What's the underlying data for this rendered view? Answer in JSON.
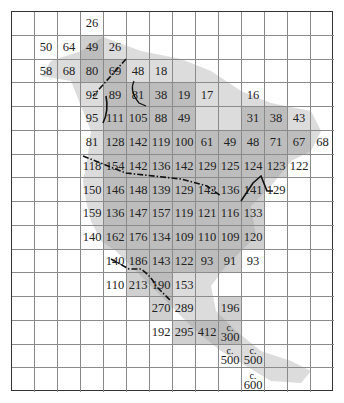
{
  "map": {
    "grid": {
      "cols": 14,
      "rows": 16
    },
    "colors": {
      "land": "#dcdcdc",
      "shaded": "#b5b5b5",
      "grid_line": "#8a8a8a",
      "border": "#333333",
      "text": "#222222"
    },
    "cells": [
      {
        "r": 0,
        "c": 3,
        "v": "26"
      },
      {
        "r": 1,
        "c": 1,
        "v": "50"
      },
      {
        "r": 1,
        "c": 2,
        "v": "64"
      },
      {
        "r": 1,
        "c": 3,
        "v": "49",
        "s": true
      },
      {
        "r": 1,
        "c": 4,
        "v": "26"
      },
      {
        "r": 2,
        "c": 1,
        "v": "58"
      },
      {
        "r": 2,
        "c": 2,
        "v": "68"
      },
      {
        "r": 2,
        "c": 3,
        "v": "80",
        "s": true
      },
      {
        "r": 2,
        "c": 4,
        "v": "69",
        "s": true
      },
      {
        "r": 2,
        "c": 5,
        "v": "48"
      },
      {
        "r": 2,
        "c": 6,
        "v": "18"
      },
      {
        "r": 3,
        "c": 3,
        "v": "92"
      },
      {
        "r": 3,
        "c": 4,
        "v": "89",
        "s": true
      },
      {
        "r": 3,
        "c": 5,
        "v": "81",
        "s": true
      },
      {
        "r": 3,
        "c": 6,
        "v": "38",
        "s": true
      },
      {
        "r": 3,
        "c": 7,
        "v": "19",
        "s": true
      },
      {
        "r": 3,
        "c": 8,
        "v": "17"
      },
      {
        "r": 3,
        "c": 10,
        "v": "16"
      },
      {
        "r": 4,
        "c": 3,
        "v": "95"
      },
      {
        "r": 4,
        "c": 4,
        "v": "111",
        "s": true
      },
      {
        "r": 4,
        "c": 5,
        "v": "105",
        "s": true
      },
      {
        "r": 4,
        "c": 6,
        "v": "88",
        "s": true
      },
      {
        "r": 4,
        "c": 7,
        "v": "49",
        "s": true
      },
      {
        "r": 4,
        "c": 10,
        "v": "31",
        "s": true
      },
      {
        "r": 4,
        "c": 11,
        "v": "38",
        "s": true
      },
      {
        "r": 4,
        "c": 12,
        "v": "43"
      },
      {
        "r": 5,
        "c": 3,
        "v": "81"
      },
      {
        "r": 5,
        "c": 4,
        "v": "128",
        "s": true
      },
      {
        "r": 5,
        "c": 5,
        "v": "142",
        "s": true
      },
      {
        "r": 5,
        "c": 6,
        "v": "119",
        "s": true
      },
      {
        "r": 5,
        "c": 7,
        "v": "100",
        "s": true
      },
      {
        "r": 5,
        "c": 8,
        "v": "61",
        "s": true
      },
      {
        "r": 5,
        "c": 9,
        "v": "49",
        "s": true
      },
      {
        "r": 5,
        "c": 10,
        "v": "48",
        "s": true
      },
      {
        "r": 5,
        "c": 11,
        "v": "71",
        "s": true
      },
      {
        "r": 5,
        "c": 12,
        "v": "67",
        "s": true
      },
      {
        "r": 5,
        "c": 13,
        "v": "68"
      },
      {
        "r": 6,
        "c": 3,
        "v": "118"
      },
      {
        "r": 6,
        "c": 4,
        "v": "154",
        "s": true
      },
      {
        "r": 6,
        "c": 5,
        "v": "142",
        "s": true
      },
      {
        "r": 6,
        "c": 6,
        "v": "136",
        "s": true
      },
      {
        "r": 6,
        "c": 7,
        "v": "142",
        "s": true
      },
      {
        "r": 6,
        "c": 8,
        "v": "129",
        "s": true
      },
      {
        "r": 6,
        "c": 9,
        "v": "125",
        "s": true
      },
      {
        "r": 6,
        "c": 10,
        "v": "124",
        "s": true
      },
      {
        "r": 6,
        "c": 11,
        "v": "123",
        "s": true
      },
      {
        "r": 6,
        "c": 12,
        "v": "122"
      },
      {
        "r": 7,
        "c": 3,
        "v": "150"
      },
      {
        "r": 7,
        "c": 4,
        "v": "146",
        "s": true
      },
      {
        "r": 7,
        "c": 5,
        "v": "148",
        "s": true
      },
      {
        "r": 7,
        "c": 6,
        "v": "139",
        "s": true
      },
      {
        "r": 7,
        "c": 7,
        "v": "129",
        "s": true
      },
      {
        "r": 7,
        "c": 8,
        "v": "142",
        "s": true
      },
      {
        "r": 7,
        "c": 9,
        "v": "136",
        "s": true
      },
      {
        "r": 7,
        "c": 10,
        "v": "141",
        "s": true
      },
      {
        "r": 7,
        "c": 11,
        "v": "129"
      },
      {
        "r": 8,
        "c": 3,
        "v": "159"
      },
      {
        "r": 8,
        "c": 4,
        "v": "136",
        "s": true
      },
      {
        "r": 8,
        "c": 5,
        "v": "147",
        "s": true
      },
      {
        "r": 8,
        "c": 6,
        "v": "157",
        "s": true
      },
      {
        "r": 8,
        "c": 7,
        "v": "119",
        "s": true
      },
      {
        "r": 8,
        "c": 8,
        "v": "121",
        "s": true
      },
      {
        "r": 8,
        "c": 9,
        "v": "116",
        "s": true
      },
      {
        "r": 8,
        "c": 10,
        "v": "133",
        "s": true
      },
      {
        "r": 9,
        "c": 3,
        "v": "140"
      },
      {
        "r": 9,
        "c": 4,
        "v": "162",
        "s": true
      },
      {
        "r": 9,
        "c": 5,
        "v": "176",
        "s": true
      },
      {
        "r": 9,
        "c": 6,
        "v": "134",
        "s": true
      },
      {
        "r": 9,
        "c": 7,
        "v": "109",
        "s": true
      },
      {
        "r": 9,
        "c": 8,
        "v": "110",
        "s": true
      },
      {
        "r": 9,
        "c": 9,
        "v": "109",
        "s": true
      },
      {
        "r": 9,
        "c": 10,
        "v": "120",
        "s": true
      },
      {
        "r": 10,
        "c": 4,
        "v": "140"
      },
      {
        "r": 10,
        "c": 5,
        "v": "186",
        "s": true
      },
      {
        "r": 10,
        "c": 6,
        "v": "143",
        "s": true
      },
      {
        "r": 10,
        "c": 7,
        "v": "122",
        "s": true
      },
      {
        "r": 10,
        "c": 8,
        "v": "93",
        "s": true
      },
      {
        "r": 10,
        "c": 9,
        "v": "91",
        "s": true
      },
      {
        "r": 10,
        "c": 10,
        "v": "93"
      },
      {
        "r": 11,
        "c": 4,
        "v": "110"
      },
      {
        "r": 11,
        "c": 5,
        "v": "213",
        "s": true
      },
      {
        "r": 11,
        "c": 6,
        "v": "190",
        "s": true
      },
      {
        "r": 11,
        "c": 7,
        "v": "153"
      },
      {
        "r": 12,
        "c": 6,
        "v": "270",
        "s": true
      },
      {
        "r": 12,
        "c": 7,
        "v": "289"
      },
      {
        "r": 12,
        "c": 9,
        "v": "196",
        "s": true
      },
      {
        "r": 13,
        "c": 6,
        "v": "192"
      },
      {
        "r": 13,
        "c": 7,
        "v": "295",
        "s": true
      },
      {
        "r": 13,
        "c": 8,
        "v": "412",
        "s": true
      },
      {
        "r": 13,
        "c": 9,
        "v": "300",
        "pre": "c.",
        "s": true
      },
      {
        "r": 14,
        "c": 9,
        "v": "500",
        "pre": "c."
      },
      {
        "r": 14,
        "c": 10,
        "v": "500",
        "pre": "c."
      },
      {
        "r": 15,
        "c": 10,
        "v": "600",
        "pre": "c."
      }
    ]
  }
}
